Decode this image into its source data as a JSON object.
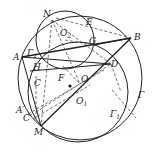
{
  "diagram": {
    "type": "geometry",
    "circles": [
      {
        "name": "Γ",
        "label": "Γ",
        "center": [
          80,
          82
        ],
        "r": 62
      },
      {
        "name": "Γ1",
        "label": "Γ",
        "sub": "1",
        "center": [
          76,
          92
        ],
        "r": 50
      },
      {
        "name": "Γ2",
        "label": "Γ",
        "sub": "2",
        "center": [
          65,
          40
        ],
        "r": 29
      }
    ],
    "points": {
      "N": {
        "label": "N",
        "pos": [
          57,
          20
        ]
      },
      "E": {
        "label": "E",
        "pos": [
          87,
          21
        ]
      },
      "O2": {
        "label": "O",
        "sub": "2",
        "pos": [
          65,
          38
        ]
      },
      "G": {
        "label": "G",
        "pos": [
          94,
          43
        ]
      },
      "B": {
        "label": "B",
        "pos": [
          131,
          38
        ]
      },
      "A": {
        "label": "A",
        "pos": [
          13,
          57
        ]
      },
      "H": {
        "label": "H",
        "pos": [
          35,
          65
        ]
      },
      "D": {
        "label": "D",
        "pos": [
          111,
          63
        ]
      },
      "C": {
        "label": "C",
        "pos": [
          38,
          83
        ]
      },
      "F": {
        "label": "F",
        "pos": [
          63,
          79
        ]
      },
      "O": {
        "label": "O",
        "pos": [
          80,
          82
        ]
      },
      "O1": {
        "label": "O",
        "sub": "1",
        "pos": [
          76,
          92
        ]
      },
      "A_prime": {
        "label": "A′",
        "pos": [
          17,
          111
        ]
      },
      "C_prime": {
        "label": "C′",
        "pos": [
          23,
          119
        ]
      },
      "M": {
        "label": "M",
        "pos": [
          41,
          127
        ]
      }
    }
  },
  "labels": {
    "N": "N",
    "E": "E",
    "O2": "O",
    "O2_sub": "2",
    "G": "G",
    "B": "B",
    "A": "A",
    "Gamma2": "Γ",
    "Gamma2_sub": "2",
    "H": "H",
    "D": "D",
    "C": "C",
    "F": "F",
    "O": "O",
    "O1": "O",
    "O1_sub": "1",
    "A_prime": "A′",
    "C_prime": "C′",
    "M": "M",
    "Gamma": "Γ",
    "Gamma1": "Γ",
    "Gamma1_sub": "1"
  }
}
